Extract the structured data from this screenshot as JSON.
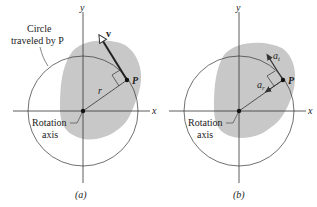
{
  "colors": {
    "body_fill": "#c8c8c8",
    "line": "#333333",
    "background": "#ffffff"
  },
  "panel_a": {
    "caption": "(a)",
    "axis_x": "x",
    "axis_y": "y",
    "circle_label_line1": "Circle",
    "circle_label_line2": "traveled by P",
    "rotation_label_line1": "Rotation",
    "rotation_label_line2": "axis",
    "point_label": "P",
    "radius_label": "r",
    "velocity_label": "v"
  },
  "panel_b": {
    "caption": "(b)",
    "axis_x": "x",
    "axis_y": "y",
    "rotation_label_line1": "Rotation",
    "rotation_label_line2": "axis",
    "point_label": "P",
    "tangential_accel_label": "a",
    "tangential_accel_subscript": "t",
    "radial_accel_label": "a",
    "radial_accel_subscript": "r"
  }
}
